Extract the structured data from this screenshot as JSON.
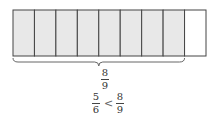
{
  "diagram": {
    "total_parts": 9,
    "shaded_parts": 8,
    "shade_color": "#e8e8e8",
    "stroke_color": "#444444",
    "brace_label": {
      "numerator": "8",
      "denominator": "9"
    },
    "comparison": {
      "left": {
        "numerator": "5",
        "denominator": "6"
      },
      "operator": "<",
      "right": {
        "numerator": "8",
        "denominator": "9"
      }
    }
  }
}
